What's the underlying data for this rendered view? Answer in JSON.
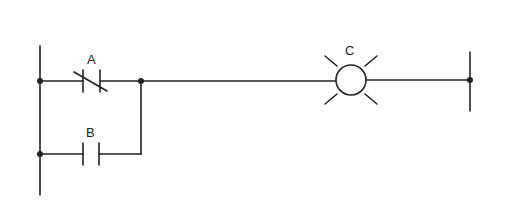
{
  "diagram": {
    "type": "ladder-logic",
    "colors": {
      "line": "#222222",
      "background": "#ffffff"
    },
    "left_rail": {
      "x": 40,
      "y_top": 46,
      "y_bottom": 195
    },
    "right_rail": {
      "x": 470,
      "y_top": 52,
      "y_bottom": 111
    },
    "elements": [
      {
        "id": "A",
        "label": "A",
        "kind": "normally-closed-contact",
        "rung": 1
      },
      {
        "id": "B",
        "label": "B",
        "kind": "normally-open-contact",
        "rung": 2,
        "parallel_with": "A"
      },
      {
        "id": "C",
        "label": "C",
        "kind": "lamp-output",
        "rung": 1
      }
    ]
  }
}
